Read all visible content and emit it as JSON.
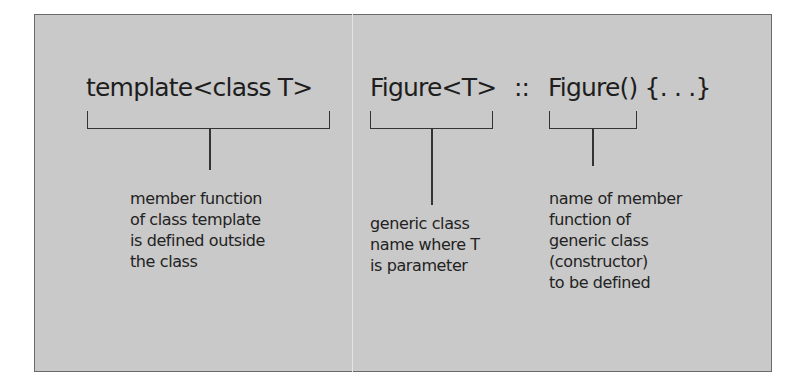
{
  "diagram": {
    "code_parts": [
      {
        "text": "template<class T>"
      },
      {
        "text": "Figure<T>"
      },
      {
        "text": "::"
      },
      {
        "text": "Figure() {. . .}"
      }
    ],
    "annotations": [
      {
        "lines": [
          "member function",
          "of class template",
          "is defined outside",
          "the class"
        ]
      },
      {
        "lines": [
          "generic class",
          "name where T",
          "is parameter"
        ]
      },
      {
        "lines": [
          "name of member",
          "function of",
          "generic class",
          "(constructor)",
          "to be defined"
        ]
      }
    ]
  }
}
